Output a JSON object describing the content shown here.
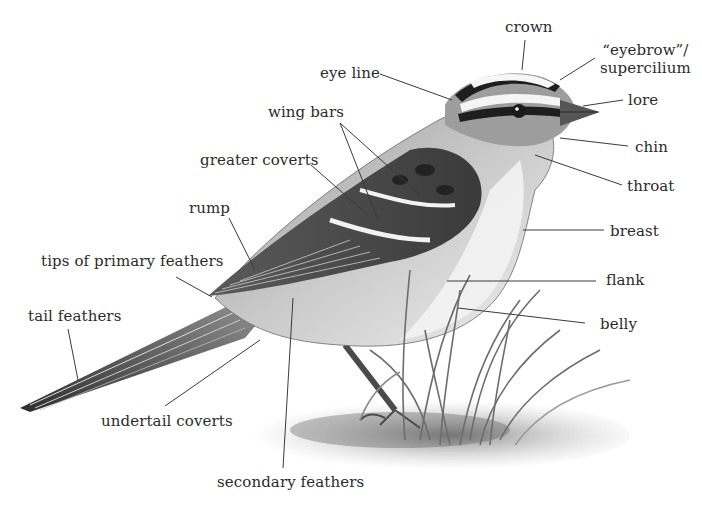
{
  "diagram": {
    "labels": {
      "crown": "crown",
      "eyebrow_line1": "“eyebrow”/",
      "eyebrow_line2": "supercilium",
      "eye_line": "eye line",
      "lore": "lore",
      "wing_bars": "wing bars",
      "chin": "chin",
      "greater_coverts": "greater coverts",
      "throat": "throat",
      "rump": "rump",
      "breast": "breast",
      "tips_of_primary_feathers": "tips of primary feathers",
      "flank": "flank",
      "tail_feathers": "tail feathers",
      "belly": "belly",
      "undertail_coverts": "undertail coverts",
      "secondary_feathers": "secondary feathers"
    },
    "colors": {
      "background": "#ffffff",
      "ink": "#2b2b2b",
      "leader_line": "#3a3a3a",
      "plumage_dark": "#2a2a2a",
      "plumage_mid": "#8a8a8a",
      "plumage_light": "#d6d6d6"
    }
  }
}
